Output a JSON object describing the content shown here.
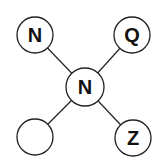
{
  "diagram": {
    "type": "letter-network-puzzle",
    "center": {
      "label": "N",
      "x": 85,
      "y": 87
    },
    "nodes": [
      {
        "id": "top-left",
        "label": "N",
        "x": 35,
        "y": 35
      },
      {
        "id": "top-right",
        "label": "Q",
        "x": 132,
        "y": 35
      },
      {
        "id": "bottom-left",
        "label": "",
        "x": 35,
        "y": 137
      },
      {
        "id": "bottom-right",
        "label": "Z",
        "x": 133,
        "y": 138
      }
    ],
    "node_radius": 18,
    "colors": {
      "stroke": "#222222",
      "fill": "#ffffff",
      "text": "#111111"
    }
  }
}
